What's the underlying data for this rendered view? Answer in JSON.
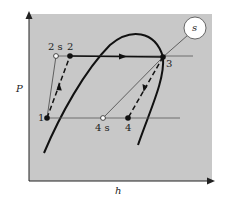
{
  "diagram": {
    "type": "P-h diagram (refrigeration cycle)",
    "axes": {
      "x_label": "h",
      "y_label": "P"
    },
    "points": [
      {
        "id": "1",
        "label": "1",
        "x": 47,
        "y": 118,
        "marker": "filled"
      },
      {
        "id": "2",
        "label": "2",
        "x": 70,
        "y": 56,
        "marker": "filled"
      },
      {
        "id": "2s",
        "label": "2 s",
        "x": 56,
        "y": 56,
        "marker": "open"
      },
      {
        "id": "3",
        "label": "3",
        "x": 163,
        "y": 57,
        "marker": "filled"
      },
      {
        "id": "4",
        "label": "4",
        "x": 128,
        "y": 118,
        "marker": "filled"
      },
      {
        "id": "4s",
        "label": "4 s",
        "x": 103,
        "y": 118,
        "marker": "open"
      }
    ],
    "isentrope_bubble": {
      "label": "s"
    },
    "colors": {
      "plot_bg": "#c8c8c8",
      "line": "#1a1a1a",
      "thin_line": "#4a4a4a"
    }
  }
}
